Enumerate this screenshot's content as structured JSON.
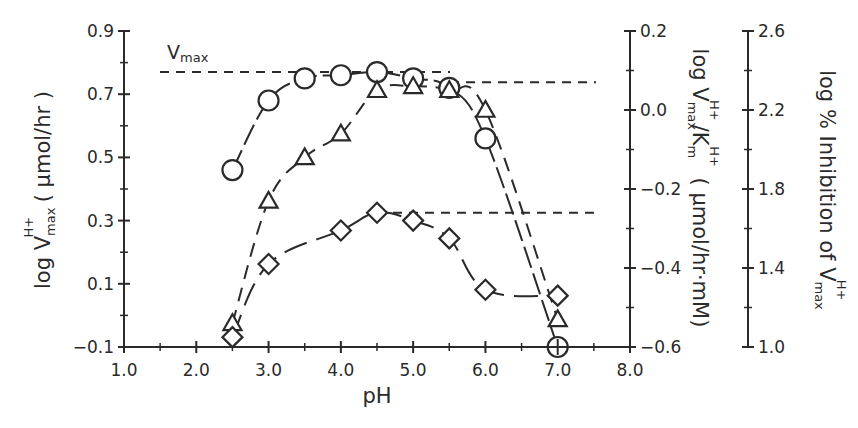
{
  "chart_data": {
    "type": "line",
    "title": "",
    "xlabel": "pH",
    "xlim": [
      1.0,
      8.0
    ],
    "x_ticks": [
      "1.0",
      "2.0",
      "3.0",
      "4.0",
      "5.0",
      "6.0",
      "7.0",
      "8.0"
    ],
    "grid": false,
    "legend": "none",
    "axes": {
      "left": {
        "label_main": "log V",
        "label_sub": "max",
        "label_sup": "H+",
        "label_unit": " ( μmol/hr )",
        "ylim": [
          -0.1,
          0.9
        ],
        "ticks": [
          "-0.1",
          "0.1",
          "0.3",
          "0.5",
          "0.7",
          "0.9"
        ]
      },
      "middle": {
        "label_text": "log V",
        "label_sub": "max",
        "label_sup": "H+",
        "label_mid": "/K",
        "label_sub2": "m",
        "label_sup2": "H+",
        "label_unit": " ( μmol/hr·mM)",
        "ylim": [
          -0.6,
          0.2
        ],
        "ticks": [
          "-0.6",
          "-0.4",
          "-0.2",
          "0.0",
          "0.2"
        ]
      },
      "right": {
        "label_text": "log % Inhibition of V",
        "label_sub": "max",
        "label_sup": "H+",
        "ylim": [
          1.0,
          2.6
        ],
        "ticks": [
          "1.0",
          "1.4",
          "1.8",
          "2.2",
          "2.6"
        ]
      }
    },
    "annotations": {
      "vmax_label_main": "V",
      "vmax_label_sub": "max",
      "vmax_reference_line_left_axis": 0.77,
      "upper_right_reference_line_middle_axis": 0.07,
      "lower_right_reference_line_right_axis": 1.68
    },
    "series": [
      {
        "name": "log Vmax (circles)",
        "marker": "circle",
        "axis": "left",
        "x": [
          2.5,
          3.0,
          3.5,
          4.0,
          4.5,
          5.0,
          5.5,
          6.0,
          7.0
        ],
        "values": [
          0.46,
          0.68,
          0.75,
          0.76,
          0.77,
          0.75,
          0.72,
          0.56,
          -0.1
        ]
      },
      {
        "name": "log Vmax/Km (triangles)",
        "marker": "triangle",
        "axis": "middle",
        "x": [
          2.5,
          3.0,
          3.5,
          4.0,
          4.5,
          5.0,
          5.5,
          6.0,
          7.0
        ],
        "values": [
          -0.54,
          -0.23,
          -0.12,
          -0.06,
          0.05,
          0.06,
          0.05,
          0.0,
          -0.53
        ]
      },
      {
        "name": "log % Inhibition of Vmax (diamonds)",
        "marker": "diamond",
        "axis": "right",
        "x": [
          2.5,
          3.0,
          4.0,
          4.5,
          5.0,
          5.5,
          6.0,
          7.0
        ],
        "values": [
          1.05,
          1.42,
          1.59,
          1.68,
          1.64,
          1.55,
          1.29,
          1.26
        ]
      }
    ]
  }
}
